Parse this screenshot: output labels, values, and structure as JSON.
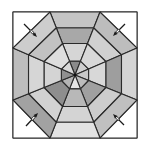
{
  "diagram": {
    "type": "octagonal-web-fold-diagram",
    "frame": {
      "x": 13,
      "y": 12,
      "width": 124,
      "height": 126,
      "fill": "#ffffff",
      "stroke": "#3a3a3a"
    },
    "center": {
      "x": 75,
      "y": 75
    },
    "ring_fractions": [
      0.22,
      0.5,
      0.75,
      1.0
    ],
    "octagon_outer_vertices": [
      [
        50,
        12
      ],
      [
        100,
        12
      ],
      [
        137,
        48
      ],
      [
        137,
        100
      ],
      [
        100,
        138
      ],
      [
        50,
        138
      ],
      [
        13,
        100
      ],
      [
        13,
        48
      ]
    ],
    "sectors": [
      {
        "name": "top",
        "shades": [
          "#8a8a8a",
          "#d6d6d6",
          "#a8a8a8",
          "#c4c4c4"
        ]
      },
      {
        "name": "top-right",
        "shades": [
          "#cfcfcf",
          "#d8d8d8",
          "#d0d0d0",
          "#bdbdbd"
        ]
      },
      {
        "name": "right",
        "shades": [
          "#c8c8c8",
          "#d8d8d8",
          "#9e9e9e",
          "#d4d4d4"
        ]
      },
      {
        "name": "bottom-right",
        "shades": [
          "#bcbcbc",
          "#a0a0a0",
          "#cdcdcd",
          "#c0c0c0"
        ]
      },
      {
        "name": "bottom",
        "shades": [
          "#e4e4e4",
          "#b8b8b8",
          "#d4d4d4",
          "#e2e2e2"
        ]
      },
      {
        "name": "bottom-left",
        "shades": [
          "#b4b4b4",
          "#8e8e8e",
          "#d2d2d2",
          "#a2a2a2"
        ]
      },
      {
        "name": "left",
        "shades": [
          "#909090",
          "#d4d4d4",
          "#d6d6d6",
          "#bdbdbd"
        ]
      },
      {
        "name": "top-left",
        "shades": [
          "#d8d8d8",
          "#dedede",
          "#c2c2c2",
          "#cdcdcd"
        ]
      }
    ],
    "corner_triangles": [
      {
        "name": "top-left",
        "points": [
          [
            13,
            12
          ],
          [
            50,
            12
          ],
          [
            13,
            48
          ]
        ]
      },
      {
        "name": "top-right",
        "points": [
          [
            100,
            12
          ],
          [
            137,
            12
          ],
          [
            137,
            48
          ]
        ]
      },
      {
        "name": "bottom-right",
        "points": [
          [
            137,
            100
          ],
          [
            137,
            138
          ],
          [
            100,
            138
          ]
        ]
      },
      {
        "name": "bottom-left",
        "points": [
          [
            13,
            100
          ],
          [
            50,
            138
          ],
          [
            13,
            138
          ]
        ]
      }
    ],
    "fold_arrows": [
      {
        "name": "top-left",
        "from": [
          24,
          24
        ],
        "to": [
          37,
          37
        ]
      },
      {
        "name": "top-right",
        "from": [
          125,
          24
        ],
        "to": [
          113,
          36
        ]
      },
      {
        "name": "bottom-right",
        "from": [
          124,
          125
        ],
        "to": [
          113,
          114
        ]
      },
      {
        "name": "bottom-left",
        "from": [
          26,
          126
        ],
        "to": [
          38,
          113
        ]
      }
    ],
    "colors": {
      "line": "#2a2a2a",
      "background": "#ffffff",
      "arrow": "#1a1a1a"
    }
  }
}
